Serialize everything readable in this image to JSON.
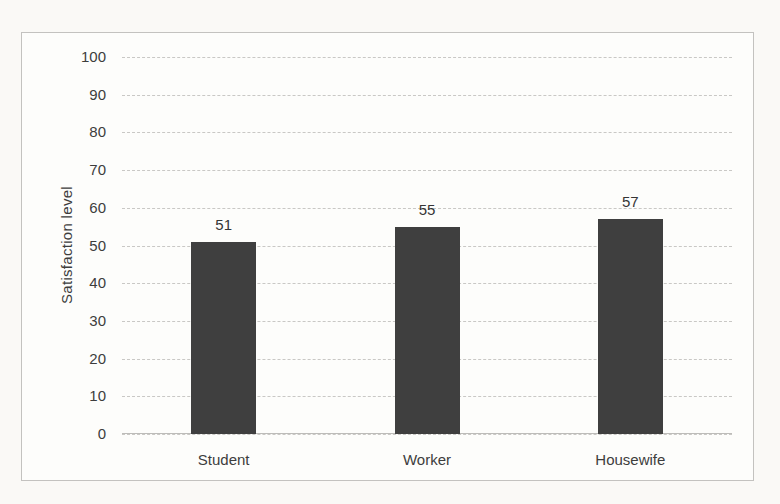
{
  "chart_data": {
    "type": "bar",
    "title": "",
    "xlabel": "",
    "ylabel": "Satisfaction level",
    "categories": [
      "Student",
      "Worker",
      "Housewife"
    ],
    "values": [
      51,
      55,
      57
    ],
    "data_labels": [
      "51",
      "55",
      "57"
    ],
    "ylim": [
      0,
      100
    ],
    "ytick_step": 10,
    "yticks": [
      0,
      10,
      20,
      30,
      40,
      50,
      60,
      70,
      80,
      90,
      100
    ],
    "grid": true,
    "gridline_style": "dashed",
    "legend": false,
    "colors": {
      "bar": "#3f3f3f",
      "gridline": "#c9c8c5",
      "frame_border": "#c3c2bf",
      "axis_line": "#bdbcb9",
      "text": "#3d3d3d",
      "chart_background": "#fdfdfb",
      "page_background": "#faf9f6"
    }
  }
}
